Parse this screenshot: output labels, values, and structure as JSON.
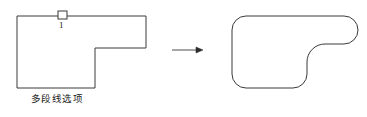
{
  "figure": {
    "background_color": "#ffffff",
    "stroke_color": "#3a3a3a",
    "text_color": "#1a1a1a",
    "caption": "多段线选项",
    "vertex_label": "1",
    "arrow_name": "transformation-arrow"
  },
  "icons": {
    "grip_square": "grip-square-icon",
    "arrow_right": "arrow-right-icon"
  },
  "shapes": {
    "source": {
      "name": "l-shaped-polyline",
      "path": "M 17 16 L 146 16 L 146 48 L 95 48 L 95 88 L 17 88 Z"
    },
    "result": {
      "name": "filleted-polyline",
      "path": "M 247 16 L 344 16 A 14 14 0 0 1 344 44 L 325 44 A 18 18 0 0 0 307 62 L 307 74 A 14 14 0 0 1 293 88 L 246 88 A 14 14 0 0 1 232 74 L 232 30 A 14 14 0 0 1 246 16 Z"
    },
    "grip": {
      "name": "grip-square",
      "x": 58,
      "y": 11,
      "width": 9,
      "height": 8
    },
    "arrow": {
      "name": "arrow-right",
      "x1": 172,
      "y1": 50,
      "x2": 202,
      "y2": 50
    }
  }
}
